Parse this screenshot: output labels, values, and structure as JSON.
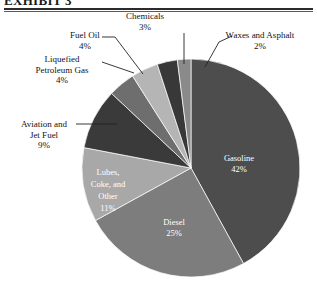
{
  "page": {
    "title_cropped": "EXHIBIT 3"
  },
  "chart_data": {
    "type": "pie",
    "title": "",
    "unit": "%",
    "start_angle_deg": 0,
    "direction": "clockwise",
    "legend": "none",
    "labels_inside": [
      "Gasoline",
      "Diesel"
    ],
    "categories": [
      "Gasoline",
      "Diesel",
      "Lubes, Coke, and Other",
      "Aviation and Jet Fuel",
      "Liquefied Petroleum Gas",
      "Fuel Oil",
      "Chemicals",
      "Waxes and Asphalt"
    ],
    "values": [
      42,
      25,
      11,
      9,
      4,
      4,
      3,
      2
    ],
    "colors": [
      "#4d4d4d",
      "#7d7d7d",
      "#a8a8a8",
      "#3a3a3a",
      "#6e6e6e",
      "#b5b5b5",
      "#383838",
      "#8a8a8a"
    ],
    "slices": [
      {
        "name": "Gasoline",
        "value": 42,
        "label": "Gasoline",
        "pct": "42%",
        "color": "#4d4d4d",
        "label_placement": "inside"
      },
      {
        "name": "Diesel",
        "value": 25,
        "label": "Diesel",
        "pct": "25%",
        "color": "#7d7d7d",
        "label_placement": "inside"
      },
      {
        "name": "Lubes, Coke, and Other",
        "value": 11,
        "label": "Lubes, Coke, and Other",
        "pct": "11%",
        "color": "#a8a8a8",
        "label_placement": "inside"
      },
      {
        "name": "Aviation and Jet Fuel",
        "value": 9,
        "label": "Aviation and Jet Fuel",
        "pct": "9%",
        "color": "#3a3a3a",
        "label_placement": "callout"
      },
      {
        "name": "Liquefied Petroleum Gas",
        "value": 4,
        "label": "Liquefied Petroleum Gas",
        "pct": "4%",
        "color": "#6e6e6e",
        "label_placement": "callout"
      },
      {
        "name": "Fuel Oil",
        "value": 4,
        "label": "Fuel Oil",
        "pct": "4%",
        "color": "#b5b5b5",
        "label_placement": "callout"
      },
      {
        "name": "Chemicals",
        "value": 3,
        "label": "Chemicals",
        "pct": "3%",
        "color": "#383838",
        "label_placement": "callout"
      },
      {
        "name": "Waxes and Asphalt",
        "value": 2,
        "label": "Waxes and Asphalt",
        "pct": "2%",
        "color": "#8a8a8a",
        "label_placement": "callout"
      }
    ]
  },
  "inside_labels": {
    "gasoline": {
      "name": "Gasoline",
      "pct": "42%"
    },
    "diesel": {
      "name": "Diesel",
      "pct": "25%"
    },
    "lubes_line1": "Lubes,",
    "lubes_line2": "Coke, and",
    "lubes_line3": "Other",
    "lubes_pct": "11%"
  },
  "callouts": {
    "chemicals": {
      "name": "Chemicals",
      "pct": "3%"
    },
    "waxes": {
      "name": "Waxes and Asphalt",
      "pct": "2%"
    },
    "fuel_oil": {
      "name": "Fuel Oil",
      "pct": "4%"
    },
    "lpg": {
      "line1": "Liquefied",
      "line2": "Petroleum Gas",
      "pct": "4%"
    },
    "aviation": {
      "line1": "Aviation and",
      "line2": "Jet Fuel",
      "pct": "9%"
    }
  }
}
